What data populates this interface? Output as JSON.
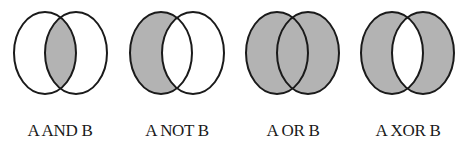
{
  "diagrams": [
    {
      "label": "A AND B",
      "operation": "and",
      "cx": 60
    },
    {
      "label": "A NOT B",
      "operation": "not",
      "cx": 177
    },
    {
      "label": "A OR B",
      "operation": "or",
      "cx": 293
    },
    {
      "label": "A XOR B",
      "operation": "xor",
      "cx": 408
    }
  ],
  "colors": {
    "fill": "#b3b3b3",
    "stroke": "#1a1a1a",
    "background": "#ffffff"
  }
}
